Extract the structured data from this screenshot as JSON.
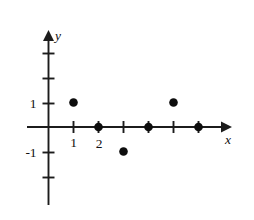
{
  "chart_data": {
    "type": "scatter",
    "title": "",
    "xlabel": "x",
    "ylabel": "y",
    "grid": false,
    "legend": null,
    "xlim": [
      -0.6,
      7.3
    ],
    "ylim": [
      -3.3,
      3.7
    ],
    "x_tick_values": [
      1,
      2,
      3,
      4,
      5,
      6
    ],
    "x_tick_labels": [
      "1",
      "2",
      "",
      "",
      "",
      ""
    ],
    "y_tick_values": [
      -2,
      -1,
      1,
      2,
      3
    ],
    "y_tick_labels": [
      "",
      "-1",
      "1",
      "",
      ""
    ],
    "points": [
      {
        "x": 1,
        "y": 1
      },
      {
        "x": 2,
        "y": 0
      },
      {
        "x": 3,
        "y": -1
      },
      {
        "x": 4,
        "y": 0
      },
      {
        "x": 5,
        "y": 1
      },
      {
        "x": 6,
        "y": 0
      }
    ],
    "point_color": "#0d0d0d",
    "axis_color": "#1c1c1c",
    "background_color": "#ffffff"
  },
  "labels": {
    "x_axis_name": "x",
    "y_axis_name": "y",
    "x_tick_1": "1",
    "x_tick_2": "2",
    "y_tick_pos1": "1",
    "y_tick_neg1": "-1"
  }
}
